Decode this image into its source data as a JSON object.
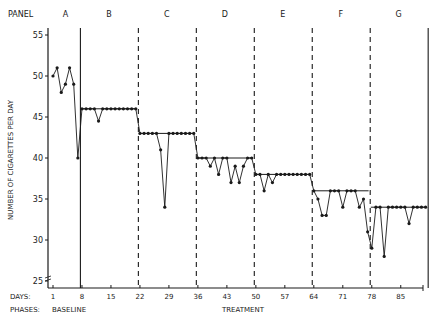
{
  "chart_data": {
    "type": "line",
    "title": "",
    "xlabel": "DAYS",
    "ylabel": "NUMBER OF CIGARETTES PER DAY",
    "ylim": [
      24,
      56
    ],
    "xlim": [
      1,
      92
    ],
    "y_ticks": [
      25,
      30,
      35,
      40,
      45,
      50,
      55
    ],
    "x_ticks": [
      1,
      8,
      15,
      22,
      29,
      36,
      43,
      50,
      57,
      64,
      71,
      78,
      85
    ],
    "grid": false,
    "panel_label": "PANEL",
    "days_label": "DAYS:",
    "phases_label": "PHASES:",
    "phases": [
      {
        "name": "BASELINE",
        "panels": [
          "A"
        ]
      },
      {
        "name": "TREATMENT",
        "panels": [
          "B",
          "C",
          "D",
          "E",
          "F",
          "G"
        ]
      }
    ],
    "panels": [
      {
        "label": "A",
        "start_day": 1,
        "values": [
          50,
          51,
          48,
          49,
          51,
          49,
          40
        ],
        "criterion": null
      },
      {
        "label": "B",
        "start_day": 8,
        "values": [
          46,
          46,
          46,
          46,
          44.5,
          46,
          46,
          46,
          46,
          46,
          46,
          46,
          46,
          46
        ],
        "criterion": 46
      },
      {
        "label": "C",
        "start_day": 22,
        "values": [
          43,
          43,
          43,
          43,
          43,
          41,
          34,
          43,
          43,
          43,
          43,
          43,
          43,
          43
        ],
        "criterion": 43
      },
      {
        "label": "D",
        "start_day": 36,
        "values": [
          40,
          40,
          40,
          39,
          40,
          38,
          40,
          40,
          37,
          39,
          37,
          39,
          40,
          40
        ],
        "criterion": 40
      },
      {
        "label": "E",
        "start_day": 50,
        "values": [
          38,
          38,
          36,
          38,
          37,
          38,
          38,
          38,
          38,
          38,
          38,
          38,
          38,
          38
        ],
        "criterion": 38
      },
      {
        "label": "F",
        "start_day": 64,
        "values": [
          36,
          35,
          33,
          33,
          36,
          36,
          36,
          34,
          36,
          36,
          36,
          34,
          35,
          31
        ],
        "criterion": 36
      },
      {
        "label": "G",
        "start_day": 78,
        "values": [
          29,
          34,
          34,
          28,
          34,
          34,
          34,
          34,
          34,
          32,
          34,
          34,
          34,
          34
        ],
        "criterion": 34
      }
    ],
    "phase_dividers": [
      {
        "day": 7.5,
        "style": "solid"
      },
      {
        "day": 21.5,
        "style": "dashed"
      },
      {
        "day": 35.5,
        "style": "dashed"
      },
      {
        "day": 49.5,
        "style": "dashed"
      },
      {
        "day": 63.5,
        "style": "dashed"
      },
      {
        "day": 77.5,
        "style": "dashed"
      },
      {
        "day": 91.5,
        "style": "solid"
      }
    ]
  }
}
